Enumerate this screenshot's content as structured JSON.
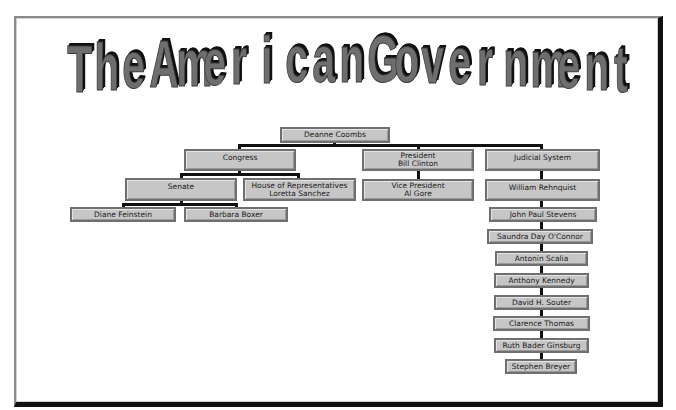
{
  "slide": {
    "title": "The American Government",
    "colors": {
      "title_fill": "#6e6e6e",
      "title_shadow": "#111111",
      "box_fill": "#c6c6c6",
      "box_border": "#6f6f6f",
      "connector": "#111111",
      "background": "#ffffff"
    }
  },
  "org_chart": {
    "root": {
      "lines": [
        "Deanne Coombs"
      ]
    },
    "branches": {
      "congress": {
        "lines": [
          "Congress"
        ],
        "senate": {
          "lines": [
            "Senate"
          ],
          "members": [
            {
              "lines": [
                "Diane Feinstein"
              ]
            },
            {
              "lines": [
                "Barbara Boxer"
              ]
            }
          ]
        },
        "house": {
          "lines": [
            "House of Representatives",
            "Loretta Sanchez"
          ]
        }
      },
      "executive": {
        "lines": [
          "President",
          "Bill Clinton"
        ],
        "vice_president": {
          "lines": [
            "Vice President",
            "Al Gore"
          ]
        }
      },
      "judicial": {
        "lines": [
          "Judicial System"
        ],
        "chief_justice": {
          "lines": [
            "William Rehnquist"
          ]
        },
        "justices": [
          {
            "lines": [
              "John Paul Stevens"
            ]
          },
          {
            "lines": [
              "Saundra Day O'Connor"
            ]
          },
          {
            "lines": [
              "Antonin Scalia"
            ]
          },
          {
            "lines": [
              "Anthony Kennedy"
            ]
          },
          {
            "lines": [
              "David H. Souter"
            ]
          },
          {
            "lines": [
              "Clarence Thomas"
            ]
          },
          {
            "lines": [
              "Ruth Bader Ginsburg"
            ]
          },
          {
            "lines": [
              "Stephen Breyer"
            ]
          }
        ]
      }
    }
  }
}
